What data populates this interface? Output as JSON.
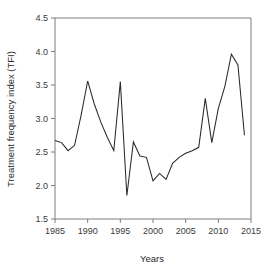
{
  "chart_data": {
    "type": "line",
    "title": "",
    "xlabel": "Years",
    "ylabel": "Treatment frequency index (TFI)",
    "xlim": [
      1985,
      2015
    ],
    "ylim": [
      1.5,
      4.5
    ],
    "xticks": [
      1985,
      1990,
      1995,
      2000,
      2005,
      2010,
      2015
    ],
    "xtick_labels": [
      "1985",
      "1990",
      "1995",
      "2000",
      "2005",
      "2010",
      "2015"
    ],
    "yticks": [
      1.5,
      2.0,
      2.5,
      3.0,
      3.5,
      4.0,
      4.5
    ],
    "ytick_labels": [
      "1.5",
      "2.0",
      "2.5",
      "3.0",
      "3.5",
      "4.0",
      "4.5"
    ],
    "grid": false,
    "legend": "none",
    "line_color": "#2a2a2a",
    "axis_color": "#7d7d7d",
    "background_color": "#ffffff",
    "x": [
      1985,
      1986,
      1987,
      1988,
      1989,
      1990,
      1991,
      1992,
      1993,
      1994,
      1995,
      1996,
      1997,
      1998,
      1999,
      2000,
      2001,
      2002,
      2003,
      2004,
      2005,
      2006,
      2007,
      2008,
      2009,
      2010,
      2011,
      2012,
      2013,
      2014
    ],
    "values": [
      2.67,
      2.64,
      2.52,
      2.6,
      3.05,
      3.56,
      3.22,
      2.95,
      2.72,
      2.52,
      3.55,
      1.85,
      2.65,
      2.44,
      2.42,
      2.07,
      2.18,
      2.09,
      2.33,
      2.42,
      2.48,
      2.52,
      2.57,
      3.3,
      2.64,
      3.15,
      3.48,
      3.96,
      3.8,
      2.75
    ],
    "series": [
      {
        "name": "Treatment frequency index (TFI)",
        "values": [
          2.67,
          2.64,
          2.52,
          2.6,
          3.05,
          3.56,
          3.22,
          2.95,
          2.72,
          2.52,
          3.55,
          1.85,
          2.65,
          2.44,
          2.42,
          2.07,
          2.18,
          2.09,
          2.33,
          2.42,
          2.48,
          2.52,
          2.57,
          3.3,
          2.64,
          3.15,
          3.48,
          3.96,
          3.8,
          2.75
        ]
      }
    ]
  }
}
